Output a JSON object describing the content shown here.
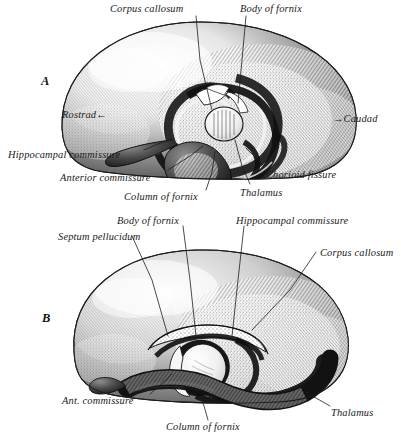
{
  "plate": {
    "background_color": "#ffffff",
    "ink_color": "#1a1a1a",
    "figure_letters": [
      {
        "name": "A",
        "text": "A",
        "x": 41,
        "y": 74
      },
      {
        "name": "B",
        "text": "B",
        "x": 42,
        "y": 311
      }
    ]
  },
  "figure_a": {
    "caption_letter": "A",
    "orientation": {
      "rostral": "Rostrad←",
      "caudal": "→Caudad"
    },
    "labels": [
      {
        "id": "corpus-callosum",
        "text": "Corpus callosum",
        "x": 110,
        "y": 4,
        "anchor": "start"
      },
      {
        "id": "body-of-fornix",
        "text": "Body of fornix",
        "x": 240,
        "y": 4,
        "anchor": "start"
      },
      {
        "id": "rostrad",
        "text": "Rostrad←",
        "x": 62,
        "y": 110,
        "anchor": "start"
      },
      {
        "id": "caudad",
        "text": "→Caudad",
        "x": 333,
        "y": 114,
        "anchor": "start"
      },
      {
        "id": "hippocampal-commissure",
        "text": "Hippocampal commissure",
        "x": 8,
        "y": 150,
        "anchor": "start"
      },
      {
        "id": "anterior-commissure",
        "text": "Anterior commissure",
        "x": 60,
        "y": 173,
        "anchor": "start"
      },
      {
        "id": "column-of-fornix",
        "text": "Column of fornix",
        "x": 124,
        "y": 192,
        "anchor": "start"
      },
      {
        "id": "thalamus",
        "text": "Thalamus",
        "x": 240,
        "y": 188,
        "anchor": "start"
      },
      {
        "id": "chorioid-fissure",
        "text": "Chorioid fissure",
        "x": 266,
        "y": 170,
        "anchor": "start"
      }
    ]
  },
  "figure_b": {
    "caption_letter": "B",
    "labels": [
      {
        "id": "body-of-fornix",
        "text": "Body of fornix",
        "x": 117,
        "y": 216,
        "anchor": "start"
      },
      {
        "id": "hippocampal-commissure",
        "text": "Hippocampal commissure",
        "x": 236,
        "y": 216,
        "anchor": "start"
      },
      {
        "id": "septum-pellucidum",
        "text": "Septum pellucidum",
        "x": 58,
        "y": 232,
        "anchor": "start"
      },
      {
        "id": "corpus-callosum",
        "text": "Corpus callosum",
        "x": 320,
        "y": 248,
        "anchor": "start"
      },
      {
        "id": "ant-commissure",
        "text": "Ant. commissure",
        "x": 62,
        "y": 396,
        "anchor": "start"
      },
      {
        "id": "thalamus",
        "text": "Thalamus",
        "x": 331,
        "y": 408,
        "anchor": "start"
      },
      {
        "id": "column-of-fornix",
        "text": "Column of fornix",
        "x": 166,
        "y": 422,
        "anchor": "start"
      }
    ]
  },
  "leaders": {
    "figure_a": [
      {
        "id": "leader-corpus-callosum",
        "points": "196,16 200,60 212,110"
      },
      {
        "id": "leader-body-of-fornix",
        "points": "246,16 242,60 238,103"
      },
      {
        "id": "leader-hippocampal-commissure",
        "points": "144,150 158,144 172,139"
      },
      {
        "id": "leader-anterior-commissure",
        "points": "168,170 190,156 203,146"
      },
      {
        "id": "leader-column-of-fornix",
        "points": "206,190 212,172 215,152"
      },
      {
        "id": "leader-thalamus",
        "points": "250,184 242,166 235,140"
      },
      {
        "id": "leader-chorioid-fissure",
        "points": "264,166 254,156 246,148"
      }
    ],
    "figure_b": [
      {
        "id": "leader-septum-pellucidum",
        "points": "132,236 152,280 168,336"
      },
      {
        "id": "leader-body-of-fornix",
        "points": "183,226 190,280 196,336"
      },
      {
        "id": "leader-hippocampal-commissure",
        "points": "244,226 238,280 232,336"
      },
      {
        "id": "leader-corpus-callosum",
        "points": "316,252 290,290 252,330"
      },
      {
        "id": "leader-ant-commissure",
        "points": "150,394 164,382 172,374"
      },
      {
        "id": "leader-thalamus",
        "points": "330,406 316,398 306,392"
      },
      {
        "id": "leader-column-of-fornix",
        "points": "208,420 204,406 200,396"
      }
    ]
  }
}
